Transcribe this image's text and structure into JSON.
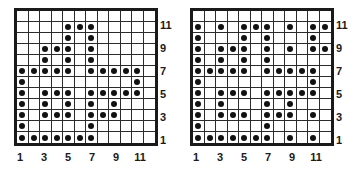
{
  "figure": {
    "background_color": "#ffffff",
    "dot_color": "#111111",
    "grid_line_color": "#2b2b2b",
    "border_color": "#1a1a1a"
  },
  "chart_data": [
    {
      "type": "heatmap",
      "title": "",
      "xlabel": "",
      "ylabel": "",
      "panel": "left",
      "grid_size": [
        12,
        12
      ],
      "xlim": [
        1,
        12
      ],
      "ylim": [
        1,
        12
      ],
      "grid": true,
      "legend": "none",
      "xtick_labels": [
        "1",
        "3",
        "5",
        "7",
        "9",
        "11"
      ],
      "xtick_values": [
        1,
        3,
        5,
        7,
        9,
        11
      ],
      "ytick_labels": [
        "1",
        "3",
        "5",
        "7",
        "9",
        "11"
      ],
      "ytick_values": [
        1,
        3,
        5,
        7,
        9,
        11
      ],
      "marker": "filled-circle",
      "values": [
        [
          0,
          0,
          0,
          0,
          0,
          0,
          0,
          0,
          0,
          0,
          0,
          0
        ],
        [
          0,
          0,
          0,
          0,
          1,
          1,
          1,
          0,
          0,
          0,
          0,
          0
        ],
        [
          0,
          0,
          0,
          0,
          1,
          0,
          1,
          0,
          0,
          0,
          0,
          0
        ],
        [
          0,
          0,
          1,
          1,
          1,
          0,
          1,
          0,
          0,
          0,
          0,
          0
        ],
        [
          0,
          0,
          1,
          0,
          1,
          0,
          1,
          0,
          0,
          0,
          0,
          0
        ],
        [
          1,
          1,
          1,
          1,
          1,
          0,
          1,
          1,
          1,
          1,
          1,
          0
        ],
        [
          1,
          0,
          0,
          0,
          0,
          0,
          0,
          0,
          0,
          0,
          1,
          0
        ],
        [
          1,
          0,
          1,
          1,
          1,
          0,
          1,
          1,
          1,
          1,
          1,
          0
        ],
        [
          1,
          0,
          1,
          0,
          1,
          0,
          1,
          0,
          1,
          0,
          0,
          0
        ],
        [
          1,
          0,
          1,
          1,
          1,
          0,
          1,
          1,
          1,
          0,
          0,
          0
        ],
        [
          1,
          0,
          0,
          0,
          0,
          0,
          1,
          0,
          0,
          0,
          0,
          0
        ],
        [
          1,
          1,
          1,
          1,
          1,
          1,
          1,
          0,
          0,
          0,
          0,
          0
        ]
      ],
      "rows_top_to_bottom": [
        12,
        11,
        10,
        9,
        8,
        7,
        6,
        5,
        4,
        3,
        2,
        1
      ]
    },
    {
      "type": "heatmap",
      "title": "",
      "xlabel": "",
      "ylabel": "",
      "panel": "right",
      "grid_size": [
        12,
        12
      ],
      "xlim": [
        1,
        12
      ],
      "ylim": [
        1,
        12
      ],
      "grid": true,
      "legend": "none",
      "xtick_labels": [
        "1",
        "3",
        "5",
        "7",
        "9",
        "11"
      ],
      "xtick_values": [
        1,
        3,
        5,
        7,
        9,
        11
      ],
      "ytick_labels": [
        "1",
        "3",
        "5",
        "7",
        "9",
        "11"
      ],
      "ytick_values": [
        1,
        3,
        5,
        7,
        9,
        11
      ],
      "marker": "filled-circle",
      "values": [
        [
          0,
          0,
          0,
          0,
          0,
          0,
          0,
          0,
          0,
          0,
          0,
          0
        ],
        [
          1,
          0,
          1,
          0,
          1,
          1,
          1,
          0,
          1,
          0,
          1,
          1
        ],
        [
          1,
          0,
          0,
          0,
          1,
          0,
          1,
          0,
          0,
          0,
          1,
          0
        ],
        [
          1,
          0,
          1,
          1,
          1,
          0,
          1,
          0,
          1,
          0,
          1,
          1
        ],
        [
          1,
          0,
          1,
          0,
          1,
          0,
          1,
          0,
          0,
          0,
          0,
          0
        ],
        [
          1,
          1,
          1,
          1,
          1,
          0,
          1,
          1,
          1,
          1,
          1,
          0
        ],
        [
          1,
          0,
          0,
          0,
          0,
          0,
          0,
          0,
          0,
          0,
          1,
          0
        ],
        [
          1,
          0,
          1,
          1,
          1,
          0,
          1,
          1,
          1,
          1,
          1,
          0
        ],
        [
          1,
          0,
          1,
          0,
          0,
          0,
          1,
          0,
          1,
          0,
          0,
          0
        ],
        [
          1,
          0,
          1,
          1,
          1,
          0,
          1,
          1,
          1,
          0,
          1,
          0
        ],
        [
          1,
          0,
          0,
          0,
          0,
          0,
          1,
          0,
          0,
          0,
          0,
          0
        ],
        [
          1,
          1,
          1,
          1,
          1,
          1,
          1,
          0,
          1,
          0,
          1,
          0
        ]
      ],
      "rows_top_to_bottom": [
        12,
        11,
        10,
        9,
        8,
        7,
        6,
        5,
        4,
        3,
        2,
        1
      ]
    }
  ]
}
